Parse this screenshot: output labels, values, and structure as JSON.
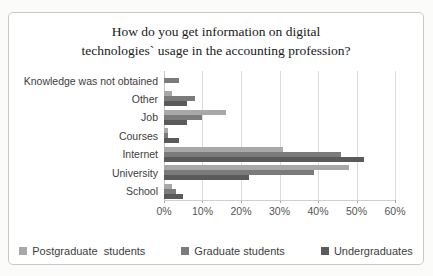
{
  "figure": {
    "title_lines": [
      "How do you get information on digital",
      "technologies` usage in the accounting profession?"
    ]
  },
  "chart_data": {
    "type": "bar",
    "orientation": "horizontal",
    "title": "How do you get information on digital technologies` usage in the accounting profession?",
    "categories": [
      "Knowledge was not obtained",
      "Other",
      "Job",
      "Courses",
      "Internet",
      "University",
      "School"
    ],
    "series": [
      {
        "name": "Postgraduate  students",
        "color": "#a8a8a8",
        "values": [
          0,
          2,
          16,
          1,
          31,
          48,
          2
        ]
      },
      {
        "name": "Graduate students",
        "color": "#7b7b7b",
        "values": [
          4,
          8,
          10,
          1,
          46,
          39,
          3
        ]
      },
      {
        "name": "Undergraduates",
        "color": "#5a5a5a",
        "values": [
          0,
          6,
          6,
          4,
          52,
          22,
          5
        ]
      }
    ],
    "xlabel": "",
    "ylabel": "",
    "xlim": [
      0,
      60
    ],
    "x_ticks": [
      "0%",
      "10%",
      "20%",
      "30%",
      "40%",
      "50%",
      "60%"
    ],
    "grid": true,
    "legend_position": "bottom"
  }
}
